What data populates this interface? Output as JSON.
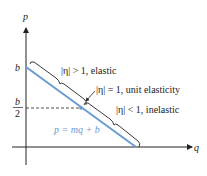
{
  "axes": {
    "x_label": "q",
    "y_label": "p"
  },
  "intercept": {
    "label": "b",
    "half_label_num": "b",
    "half_label_den": "2"
  },
  "line": {
    "equation": "p = mq + b",
    "color": "#6b9bd1"
  },
  "regions": {
    "elastic": "|η| > 1, elastic",
    "unit": "|η| = 1, unit elasticity",
    "inelastic": "|η| < 1, inelastic"
  }
}
